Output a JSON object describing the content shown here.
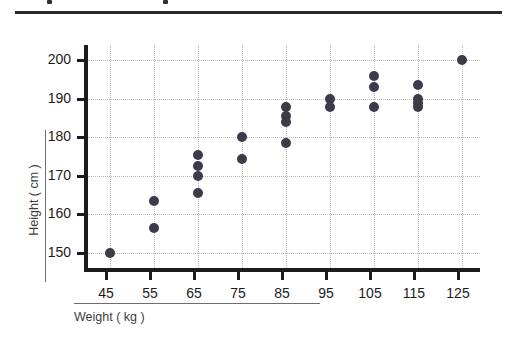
{
  "figure": {
    "top_divider": "divider",
    "background_color": "#ffffff",
    "marker_color": "#3b3b4a",
    "axis_color": "#1b1b1b",
    "grid_color": "#b9b9b9"
  },
  "chart_data": {
    "type": "scatter",
    "title": "",
    "xlabel": "Weight ( kg )",
    "ylabel": "Height ( cm )",
    "xlim": [
      40,
      130
    ],
    "ylim": [
      145,
      204
    ],
    "xticks": [
      45,
      55,
      65,
      75,
      85,
      95,
      105,
      115,
      125
    ],
    "xticklabels": [
      "45",
      "55",
      "65",
      "75",
      "85",
      "95",
      "105",
      "115",
      "125"
    ],
    "yticks": [
      150,
      160,
      170,
      180,
      190,
      200
    ],
    "yticklabels": [
      "150",
      "160",
      "170",
      "180",
      "190",
      "200"
    ],
    "grid": true,
    "grid_style": "dotted",
    "legend": null,
    "marker_size": 10,
    "points": [
      {
        "x": 45,
        "y": 150.0
      },
      {
        "x": 55,
        "y": 163.5
      },
      {
        "x": 55,
        "y": 156.5
      },
      {
        "x": 65,
        "y": 175.5
      },
      {
        "x": 65,
        "y": 172.5
      },
      {
        "x": 65,
        "y": 170.0
      },
      {
        "x": 65,
        "y": 165.5
      },
      {
        "x": 75,
        "y": 180.0
      },
      {
        "x": 75,
        "y": 174.5
      },
      {
        "x": 85,
        "y": 188.0
      },
      {
        "x": 85,
        "y": 185.5
      },
      {
        "x": 85,
        "y": 184.0
      },
      {
        "x": 85,
        "y": 178.5
      },
      {
        "x": 95,
        "y": 190.0
      },
      {
        "x": 95,
        "y": 188.0
      },
      {
        "x": 105,
        "y": 196.0
      },
      {
        "x": 105,
        "y": 193.0
      },
      {
        "x": 105,
        "y": 188.0
      },
      {
        "x": 115,
        "y": 193.5
      },
      {
        "x": 115,
        "y": 190.0
      },
      {
        "x": 115,
        "y": 189.0
      },
      {
        "x": 115,
        "y": 188.0
      },
      {
        "x": 125,
        "y": 200.0
      }
    ]
  }
}
